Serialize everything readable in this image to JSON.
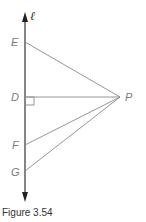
{
  "figure": {
    "caption": "Figure 3.54",
    "line_label": "ℓ",
    "points": {
      "E": {
        "label": "E"
      },
      "D": {
        "label": "D"
      },
      "F": {
        "label": "F"
      },
      "G": {
        "label": "G"
      },
      "P": {
        "label": "P"
      }
    },
    "segments": [
      "PE",
      "PD",
      "PF",
      "PG"
    ],
    "right_angle_at": "D",
    "colors": {
      "main_line": "#333333",
      "segments": "#8a8a8a",
      "labels": "#7a7a7a"
    }
  }
}
